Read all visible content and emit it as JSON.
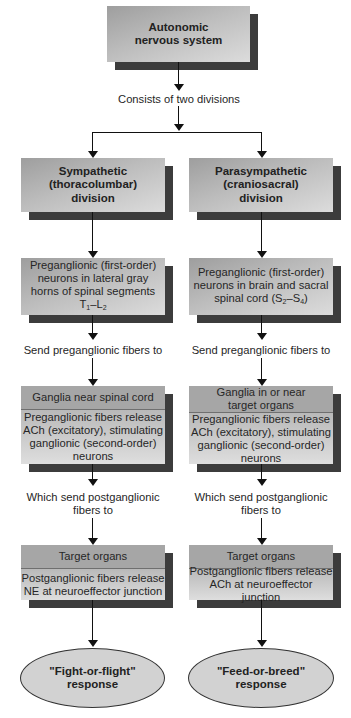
{
  "diagram": {
    "root": {
      "line1": "Autonomic",
      "line2": "nervous system"
    },
    "split_label": "Consists of two divisions",
    "columns": [
      {
        "id": "sympathetic",
        "division": {
          "line1": "Sympathetic",
          "line2": "(thoracolumbar)",
          "line3": "division"
        },
        "preganglionic": {
          "line1": "Preganglionic (first-order)",
          "line2": "neurons in lateral gray",
          "line3": "horns of spinal segments",
          "seg_a": "T",
          "seg_a_sub": "1",
          "dash": "–",
          "seg_b": "L",
          "seg_b_sub": "2"
        },
        "send_pre_label": "Send preganglionic fibers to",
        "ganglia": {
          "header": "Ganglia near spinal cord",
          "body_line1": "Preganglionic fibers release",
          "body_line2": "ACh (excitatory), stimulating",
          "body_line3": "ganglionic (second-order)",
          "body_line4": "neurons"
        },
        "send_post_label_line1": "Which send postganglionic",
        "send_post_label_line2": "fibers to",
        "target": {
          "header": "Target organs",
          "body_line1": "Postganglionic fibers release",
          "body_line2": "NE at neuroeffector junction"
        },
        "response": {
          "line1": "\"Fight-or-flight\"",
          "line2": "response"
        }
      },
      {
        "id": "parasympathetic",
        "division": {
          "line1": "Parasympathetic",
          "line2": "(craniosacral)",
          "line3": "division"
        },
        "preganglionic": {
          "line1": "Preganglionic (first-order)",
          "line2": "neurons in brain and sacral",
          "line3_prefix": "spinal cord (",
          "seg_a": "S",
          "seg_a_sub": "2",
          "dash": "–",
          "seg_b": "S",
          "seg_b_sub": "4",
          "line3_suffix": ")"
        },
        "send_pre_label": "Send preganglionic fibers to",
        "ganglia": {
          "header_line1": "Ganglia in or near",
          "header_line2": "target organs",
          "body_line1": "Preganglionic fibers release",
          "body_line2": "ACh (excitatory), stimulating",
          "body_line3": "ganglionic (second-order)",
          "body_line4": "neurons"
        },
        "send_post_label_line1": "Which send postganglionic",
        "send_post_label_line2": "fibers to",
        "target": {
          "header": "Target organs",
          "body_line1": "Postganglionic fibers release",
          "body_line2": "ACh at neuroeffector junction"
        },
        "response": {
          "line1": "\"Feed-or-breed\"",
          "line2": "response"
        }
      }
    ],
    "colors": {
      "box_gradient_dark": "#9e9e9e",
      "box_gradient_light": "#dcdcdc",
      "header_fill": "#a6a6a6",
      "shadow": "#3c3c3c",
      "ellipse_fill": "#d2d2d2",
      "line": "#111111"
    }
  }
}
